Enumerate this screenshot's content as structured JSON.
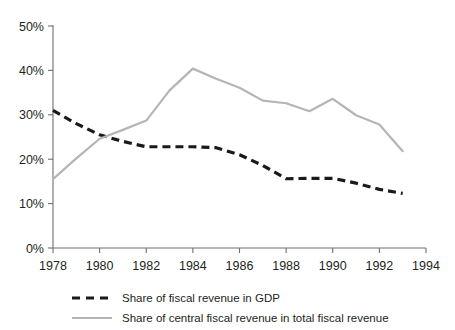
{
  "chart_data": {
    "type": "line",
    "title": "",
    "subtitle": "",
    "xlabel": "",
    "ylabel": "",
    "x": [
      1978,
      1979,
      1980,
      1981,
      1982,
      1983,
      1984,
      1985,
      1986,
      1987,
      1988,
      1989,
      1990,
      1991,
      1992,
      1993
    ],
    "xlim": [
      1978,
      1994
    ],
    "ylim": [
      0,
      50
    ],
    "grid": false,
    "legend_position": "bottom-left",
    "x_tick_labels": [
      "1978",
      "1980",
      "1982",
      "1984",
      "1986",
      "1988",
      "1990",
      "1992",
      "1994"
    ],
    "x_tick_values": [
      1978,
      1980,
      1982,
      1984,
      1986,
      1988,
      1990,
      1992,
      1994
    ],
    "y_tick_labels": [
      "0%",
      "10%",
      "20%",
      "30%",
      "40%",
      "50%"
    ],
    "y_tick_values": [
      0,
      10,
      20,
      30,
      40,
      50
    ],
    "series": [
      {
        "name": "Share of fiscal revenue in GDP",
        "style": "dashed",
        "color": "#1a1a1a",
        "values": [
          31.0,
          28.0,
          25.5,
          24.0,
          22.8,
          22.8,
          22.8,
          22.6,
          21.0,
          18.6,
          15.6,
          15.7,
          15.7,
          14.6,
          13.2,
          12.3
        ]
      },
      {
        "name": "Share of central fiscal revenue in total fiscal revenue",
        "style": "solid",
        "color": "#b5b5b5",
        "values": [
          15.5,
          20.2,
          24.6,
          26.6,
          28.7,
          35.5,
          40.4,
          38.1,
          36.1,
          33.2,
          32.6,
          30.8,
          33.6,
          29.9,
          27.8,
          21.8
        ]
      }
    ]
  },
  "legend": {
    "items": [
      {
        "label": "Share of fiscal revenue in GDP",
        "style": "dashed",
        "color": "#1a1a1a"
      },
      {
        "label": "Share of central fiscal revenue in total fiscal revenue",
        "style": "solid",
        "color": "#b5b5b5"
      }
    ]
  },
  "colors": {
    "axis": "#6f6f6f",
    "text": "#231f20",
    "series_dashed": "#1a1a1a",
    "series_solid": "#b5b5b5",
    "background": "#ffffff"
  }
}
